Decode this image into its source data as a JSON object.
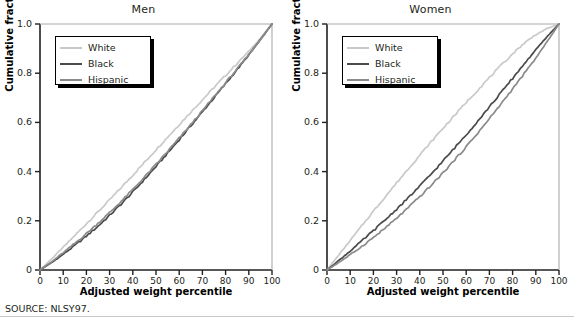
{
  "figure": {
    "source_note": "SOURCE: NLSY97.",
    "xlabel": "Adjusted weight percentile",
    "ylabel": "Cumulative fraction"
  },
  "legend": {
    "items": [
      {
        "label": "White",
        "color": "#c9c9c9"
      },
      {
        "label": "Black",
        "color": "#4a4a4a"
      },
      {
        "label": "Hispanic",
        "color": "#8a8a8a"
      }
    ]
  },
  "chart_data": [
    {
      "type": "line",
      "title": "Men",
      "xlabel": "Adjusted weight percentile",
      "ylabel": "Cumulative fraction",
      "xlim": [
        0,
        100
      ],
      "ylim": [
        0,
        1.0
      ],
      "xticks": [
        0,
        10,
        20,
        30,
        40,
        50,
        60,
        70,
        80,
        90,
        100
      ],
      "xticklabels": [
        "0",
        "10",
        "20",
        "30",
        "40",
        "50",
        "60",
        "70",
        "80",
        "90",
        "100"
      ],
      "yticks": [
        0,
        0.2,
        0.4,
        0.6,
        0.8,
        1.0
      ],
      "yticklabels": [
        "0",
        "0.2",
        "0.4",
        "0.6",
        "0.8",
        "1.0"
      ],
      "grid": false,
      "legend_position": "upper left",
      "x": [
        0,
        5,
        10,
        15,
        20,
        25,
        30,
        35,
        40,
        45,
        50,
        55,
        60,
        65,
        70,
        75,
        80,
        85,
        90,
        95,
        100
      ],
      "series": [
        {
          "name": "White",
          "color": "#c9c9c9",
          "values": [
            0.0,
            0.045,
            0.092,
            0.14,
            0.188,
            0.236,
            0.285,
            0.335,
            0.386,
            0.437,
            0.489,
            0.54,
            0.591,
            0.642,
            0.692,
            0.742,
            0.791,
            0.84,
            0.889,
            0.942,
            1.0
          ]
        },
        {
          "name": "Black",
          "color": "#4a4a4a",
          "values": [
            0.0,
            0.03,
            0.064,
            0.1,
            0.138,
            0.178,
            0.222,
            0.268,
            0.317,
            0.368,
            0.421,
            0.475,
            0.53,
            0.586,
            0.643,
            0.7,
            0.757,
            0.815,
            0.874,
            0.936,
            1.0
          ]
        },
        {
          "name": "Hispanic",
          "color": "#8a8a8a",
          "values": [
            0.0,
            0.033,
            0.07,
            0.108,
            0.148,
            0.19,
            0.233,
            0.279,
            0.327,
            0.377,
            0.429,
            0.482,
            0.536,
            0.591,
            0.647,
            0.704,
            0.761,
            0.818,
            0.876,
            0.937,
            1.0
          ]
        }
      ]
    },
    {
      "type": "line",
      "title": "Women",
      "xlabel": "Adjusted weight percentile",
      "ylabel": "Cumulative fraction",
      "xlim": [
        0,
        100
      ],
      "ylim": [
        0,
        1.0
      ],
      "xticks": [
        0,
        10,
        20,
        30,
        40,
        50,
        60,
        70,
        80,
        90,
        100
      ],
      "xticklabels": [
        "0",
        "10",
        "20",
        "30",
        "40",
        "50",
        "60",
        "70",
        "80",
        "90",
        "100"
      ],
      "yticks": [
        0,
        0.2,
        0.4,
        0.6,
        0.8,
        1.0
      ],
      "yticklabels": [
        "0",
        "0.2",
        "0.4",
        "0.6",
        "0.8",
        "1.0"
      ],
      "grid": false,
      "legend_position": "upper left",
      "x": [
        0,
        5,
        10,
        15,
        20,
        25,
        30,
        35,
        40,
        45,
        50,
        55,
        60,
        65,
        70,
        75,
        80,
        85,
        90,
        95,
        100
      ],
      "series": [
        {
          "name": "White",
          "color": "#c9c9c9",
          "values": [
            0.0,
            0.06,
            0.12,
            0.18,
            0.239,
            0.297,
            0.354,
            0.411,
            0.467,
            0.522,
            0.576,
            0.629,
            0.681,
            0.732,
            0.782,
            0.831,
            0.879,
            0.922,
            0.957,
            0.982,
            1.0
          ]
        },
        {
          "name": "Black",
          "color": "#4a4a4a",
          "values": [
            0.0,
            0.038,
            0.077,
            0.118,
            0.16,
            0.203,
            0.247,
            0.293,
            0.341,
            0.391,
            0.443,
            0.496,
            0.55,
            0.606,
            0.663,
            0.721,
            0.779,
            0.838,
            0.895,
            0.95,
            1.0
          ]
        },
        {
          "name": "Hispanic",
          "color": "#8a8a8a",
          "values": [
            0.0,
            0.03,
            0.062,
            0.096,
            0.132,
            0.17,
            0.21,
            0.253,
            0.298,
            0.345,
            0.395,
            0.447,
            0.501,
            0.557,
            0.615,
            0.675,
            0.736,
            0.798,
            0.861,
            0.93,
            1.0
          ]
        }
      ]
    }
  ]
}
